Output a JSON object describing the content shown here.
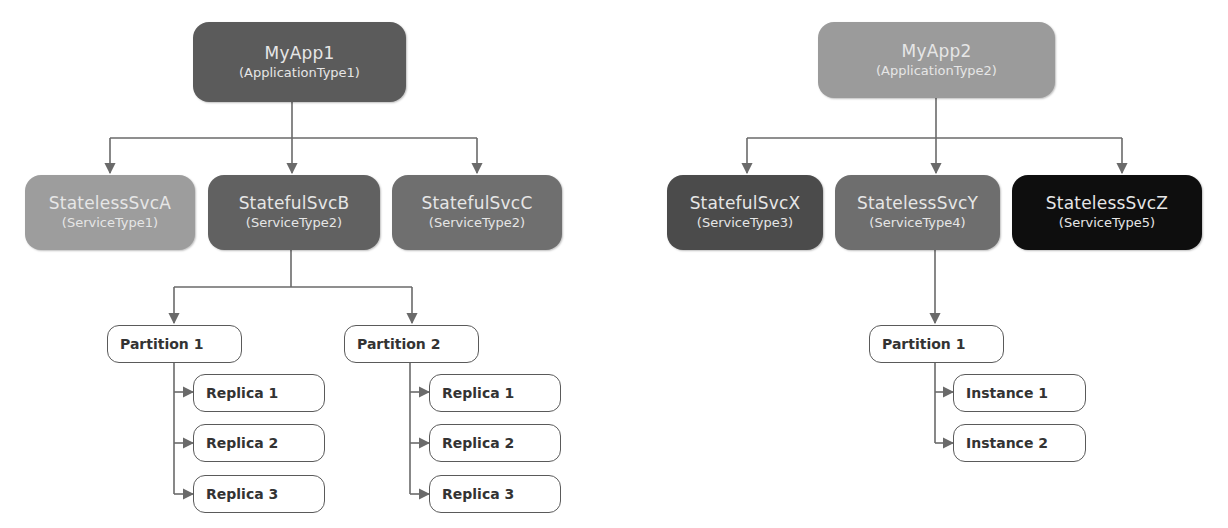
{
  "colors": {
    "app1": "#5b5b5b",
    "app2": "#9b9b9b",
    "statelessSvcA": "#9d9d9d",
    "statefulSvcB": "#616161",
    "statefulSvcC": "#6f6f6f",
    "statefulSvcX": "#4b4b4b",
    "statelessSvcY": "#6e6e6e",
    "statelessSvcZ": "#0e0e0e",
    "connector": "#6a6a6a"
  },
  "app1": {
    "name": "MyApp1",
    "type": "(ApplicationType1)",
    "services": [
      {
        "name": "StatelessSvcA",
        "type": "(ServiceType1)"
      },
      {
        "name": "StatefulSvcB",
        "type": "(ServiceType2)",
        "partitions": [
          {
            "label": "Partition 1",
            "children": [
              "Replica 1",
              "Replica 2",
              "Replica 3"
            ]
          },
          {
            "label": "Partition 2",
            "children": [
              "Replica 1",
              "Replica 2",
              "Replica 3"
            ]
          }
        ]
      },
      {
        "name": "StatefulSvcC",
        "type": "(ServiceType2)"
      }
    ]
  },
  "app2": {
    "name": "MyApp2",
    "type": "(ApplicationType2)",
    "services": [
      {
        "name": "StatefulSvcX",
        "type": "(ServiceType3)"
      },
      {
        "name": "StatelessSvcY",
        "type": "(ServiceType4)",
        "partitions": [
          {
            "label": "Partition 1",
            "children": [
              "Instance 1",
              "Instance 2"
            ]
          }
        ]
      },
      {
        "name": "StatelessSvcZ",
        "type": "(ServiceType5)"
      }
    ]
  }
}
